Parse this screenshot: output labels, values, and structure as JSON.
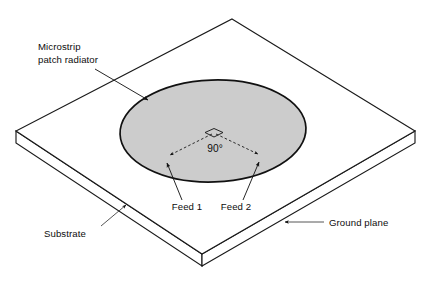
{
  "figure": {
    "background_color": "#ffffff",
    "line_color": "#1a1a1a",
    "patch_fill_color": "#cccccc",
    "patch_outline_color": "#111111"
  },
  "labels": {
    "patch_line1": "Microstrip",
    "patch_line2": "patch radiator",
    "angle": "90°",
    "feed1": "Feed 1",
    "feed2": "Feed 2",
    "substrate": "Substrate",
    "ground_plane": "Ground plane"
  },
  "geometry": {
    "slab": {
      "top_vertex": [
        232,
        19
      ],
      "left_vertex": [
        16,
        131
      ],
      "bottom_vertex": [
        202,
        254
      ],
      "right_vertex": [
        415,
        131
      ],
      "thickness_px": 12
    },
    "patch": {
      "center": [
        213,
        131
      ],
      "radius_x": 93,
      "radius_y": 51,
      "rotation_deg": -2
    },
    "angle_marker": {
      "apex": [
        214,
        131
      ],
      "value_deg": 90,
      "left_arrow_tip": [
        164,
        156
      ],
      "right_arrow_tip": [
        264,
        155
      ]
    },
    "feeds": [
      {
        "name": "Feed 1",
        "point": [
          167,
          165
        ],
        "label_anchor": [
          187,
          209
        ]
      },
      {
        "name": "Feed 2",
        "point": [
          259,
          164
        ],
        "label_anchor": [
          236,
          209
        ]
      }
    ]
  }
}
